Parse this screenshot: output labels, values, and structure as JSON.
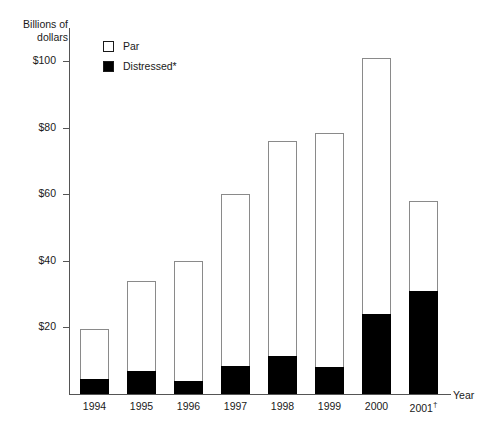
{
  "chart_data": {
    "type": "bar",
    "stacked": true,
    "title": "",
    "subtitle": "",
    "ylabel": "Billions of\ndollars",
    "xlabel": "Year",
    "categories": [
      "1994",
      "1995",
      "1996",
      "1997",
      "1998",
      "1999",
      "2000",
      "2001"
    ],
    "category_annotations": [
      "",
      "",
      "",
      "",
      "",
      "",
      "",
      "†"
    ],
    "series": [
      {
        "name": "Distressed*",
        "color": "#000000",
        "values": [
          4.5,
          7.0,
          4.0,
          8.5,
          11.5,
          8.0,
          24.0,
          31.0
        ]
      },
      {
        "name": "Par",
        "color": "#ffffff",
        "values": [
          15.0,
          27.0,
          36.0,
          51.5,
          64.5,
          70.5,
          77.0,
          27.0
        ]
      }
    ],
    "totals": [
      19.5,
      34.0,
      40.0,
      60.0,
      76.0,
      78.5,
      101.0,
      58.0
    ],
    "ylim": [
      0,
      110
    ],
    "yticks": [
      20,
      40,
      60,
      80,
      100
    ],
    "ytick_labels": [
      "$20",
      "$40",
      "$60",
      "$80",
      "$100"
    ],
    "grid": false,
    "legend_position": "top-left-inside",
    "legend_entries": [
      {
        "label": "Par",
        "swatch": "par"
      },
      {
        "label": "Distressed*",
        "swatch": "distressed"
      }
    ]
  }
}
